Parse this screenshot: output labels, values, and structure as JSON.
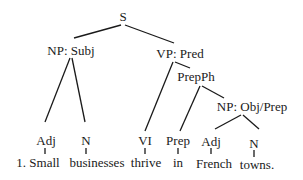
{
  "diagram": {
    "type": "parse-tree",
    "root": {
      "label": "S"
    },
    "nodes": {
      "s": "S",
      "np_subj": "NP: Subj",
      "vp_pred": "VP: Pred",
      "prepph": "PrepPh",
      "np_obj": "NP: Obj/Prep",
      "adj1": "Adj",
      "n1": "N",
      "vi": "VI",
      "prep": "Prep",
      "adj2": "Adj",
      "n2": "N"
    },
    "words": {
      "w1": "1. Small",
      "w2": "businesses",
      "w3": "thrive",
      "w4": "in",
      "w5": "French",
      "w6": "towns."
    },
    "edges": [
      [
        "S",
        "NP: Subj"
      ],
      [
        "S",
        "VP: Pred"
      ],
      [
        "NP: Subj",
        "Adj"
      ],
      [
        "NP: Subj",
        "N"
      ],
      [
        "VP: Pred",
        "VI"
      ],
      [
        "VP: Pred",
        "PrepPh"
      ],
      [
        "PrepPh",
        "Prep"
      ],
      [
        "PrepPh",
        "NP: Obj/Prep"
      ],
      [
        "NP: Obj/Prep",
        "Adj"
      ],
      [
        "NP: Obj/Prep",
        "N"
      ]
    ]
  }
}
